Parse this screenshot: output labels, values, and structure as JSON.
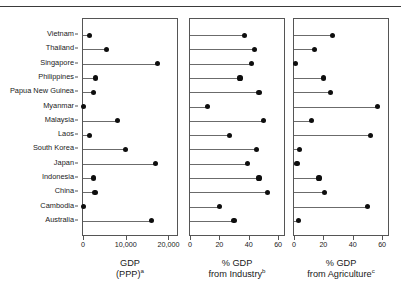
{
  "figure": {
    "countries": [
      "Vietnam",
      "Thailand",
      "Singapore",
      "Philippines",
      "Papua New Guinea",
      "Myanmar",
      "Malaysia",
      "Laos",
      "South Korea",
      "Japan",
      "Indonesia",
      "China",
      "Cambodia",
      "Australia"
    ],
    "panels": [
      {
        "id": "gdp-ppp",
        "title_line1": "GDP",
        "title_line2": "(PPP)",
        "title_superscript": "a",
        "xticks": [
          0,
          10000,
          20000
        ],
        "xticklabels": [
          "0",
          "10,000",
          "20,000"
        ],
        "xmin": 0,
        "xmax": 22000
      },
      {
        "id": "gdp-industry",
        "title_line1": "% GDP",
        "title_line2": "from Industry",
        "title_superscript": "b",
        "xticks": [
          0,
          20,
          40,
          60
        ],
        "xticklabels": [
          "0",
          "20",
          "40",
          "60"
        ],
        "xmin": 0,
        "xmax": 64
      },
      {
        "id": "gdp-agriculture",
        "title_line1": "% GDP",
        "title_line2": "from Agriculture",
        "title_superscript": "c",
        "xticks": [
          0,
          20,
          40,
          60
        ],
        "xticklabels": [
          "0",
          "20",
          "40",
          "60"
        ],
        "xmin": 0,
        "xmax": 64
      }
    ]
  },
  "chart_data": [
    {
      "type": "bar",
      "subtype": "lollipop-dot-plot",
      "title": "GDP (PPP)",
      "xlabel": "GDP (PPP)",
      "ylabel": "",
      "orientation": "horizontal",
      "grid": false,
      "legend": false,
      "xlim": [
        0,
        22000
      ],
      "xticks": [
        0,
        10000,
        20000
      ],
      "categories": [
        "Vietnam",
        "Thailand",
        "Singapore",
        "Philippines",
        "Papua New Guinea",
        "Myanmar",
        "Malaysia",
        "Laos",
        "South Korea",
        "Japan",
        "Indonesia",
        "China",
        "Cambodia",
        "Australia"
      ],
      "values": [
        1600,
        5500,
        17500,
        3000,
        2500,
        200,
        8000,
        1500,
        10000,
        17000,
        2500,
        2800,
        200,
        16000
      ],
      "note": "a"
    },
    {
      "type": "bar",
      "subtype": "lollipop-dot-plot",
      "title": "% GDP from Industry",
      "xlabel": "% GDP from Industry",
      "ylabel": "",
      "orientation": "horizontal",
      "grid": false,
      "legend": false,
      "xlim": [
        0,
        64
      ],
      "xticks": [
        0,
        20,
        40,
        60
      ],
      "categories": [
        "Vietnam",
        "Thailand",
        "Singapore",
        "Philippines",
        "Papua New Guinea",
        "Myanmar",
        "Malaysia",
        "Laos",
        "South Korea",
        "Japan",
        "Indonesia",
        "China",
        "Cambodia",
        "Australia"
      ],
      "values": [
        37,
        44,
        42,
        34,
        47,
        12,
        50,
        27,
        45,
        39,
        47,
        53,
        20,
        30
      ],
      "note": "b"
    },
    {
      "type": "bar",
      "subtype": "lollipop-dot-plot",
      "title": "% GDP from Agriculture",
      "xlabel": "% GDP from Agriculture",
      "ylabel": "",
      "orientation": "horizontal",
      "grid": false,
      "legend": false,
      "xlim": [
        0,
        64
      ],
      "xticks": [
        0,
        20,
        40,
        60
      ],
      "categories": [
        "Vietnam",
        "Thailand",
        "Singapore",
        "Philippines",
        "Papua New Guinea",
        "Myanmar",
        "Malaysia",
        "Laos",
        "South Korea",
        "Japan",
        "Indonesia",
        "China",
        "Cambodia",
        "Australia"
      ],
      "values": [
        26,
        14,
        1,
        20,
        25,
        57,
        12,
        52,
        4,
        2,
        17,
        21,
        50,
        3
      ],
      "note": "c"
    }
  ]
}
